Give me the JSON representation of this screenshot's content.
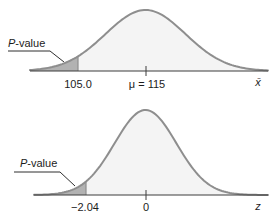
{
  "figure": {
    "colors": {
      "background": "#ffffff",
      "curve_stroke": "#8e8e8e",
      "curve_fill": "#f4f4f4",
      "shade_fill": "#b2b2b2",
      "axis": "#3c3c3c",
      "leader": "#2f2f2f",
      "text": "#1c1c1c"
    },
    "charts": {
      "top": {
        "p_label_italic": "P",
        "p_label_rest": "-value",
        "critical_label": "105.0",
        "mean_label": "μ = 115",
        "axis_label": "x̄"
      },
      "bottom": {
        "p_label_italic": "P",
        "p_label_rest": "-value",
        "critical_label": "−2.04",
        "mean_label": "0",
        "axis_label": "z"
      }
    }
  },
  "chart_data": [
    {
      "type": "area",
      "title": "",
      "description": "Normal sampling distribution of x̄ centered at μ = 115 with left tail shaded below 105.0 representing the P-value",
      "xlabel": "x̄",
      "mean": 115,
      "mean_tick_label": "μ = 115",
      "critical_value": 105.0,
      "critical_tick_label": "105.0",
      "shaded_region": "left tail, x̄ ≤ 105.0",
      "annotations": [
        "P-value"
      ],
      "legend": "none",
      "grid": false
    },
    {
      "type": "area",
      "title": "",
      "description": "Standard normal z distribution centered at 0 with left tail shaded below −2.04 representing the P-value",
      "xlabel": "z",
      "mean": 0,
      "mean_tick_label": "0",
      "critical_value": -2.04,
      "critical_tick_label": "−2.04",
      "shaded_region": "left tail, z ≤ −2.04",
      "annotations": [
        "P-value"
      ],
      "legend": "none",
      "grid": false
    }
  ]
}
